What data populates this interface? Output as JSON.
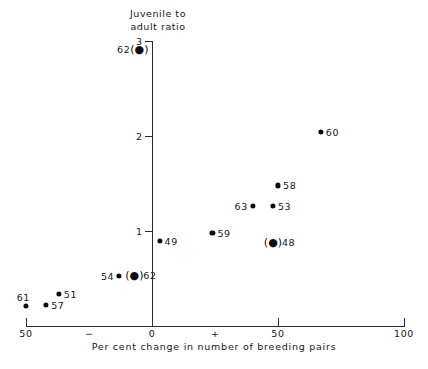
{
  "chart_data": {
    "type": "scatter",
    "title": "",
    "ylabel": "Juvenile to\nadult ratio",
    "xlabel": "Per cent change in number of breeding pairs",
    "xlim": [
      -50,
      100
    ],
    "ylim": [
      0,
      3
    ],
    "xticks": [
      -50,
      0,
      50,
      100
    ],
    "xticklabels": [
      "50",
      "0",
      "50",
      "100"
    ],
    "x_sign_minus": "−",
    "x_sign_plus": "+",
    "yticks": [
      1,
      2,
      3
    ],
    "yticklabels": [
      "1",
      "2",
      "3"
    ],
    "grid": false,
    "legend": null,
    "marker_color": "#0d0d0d",
    "points": [
      {
        "label": "62",
        "x": -5,
        "y": 2.92,
        "bracketed": true,
        "label_side": "left"
      },
      {
        "label": "60",
        "x": 67,
        "y": 2.04,
        "bracketed": false,
        "label_side": "right"
      },
      {
        "label": "58",
        "x": 50,
        "y": 1.48,
        "bracketed": false,
        "label_side": "right"
      },
      {
        "label": "63",
        "x": 40,
        "y": 1.26,
        "bracketed": false,
        "label_side": "left"
      },
      {
        "label": "53",
        "x": 48,
        "y": 1.26,
        "bracketed": false,
        "label_side": "right"
      },
      {
        "label": "59",
        "x": 24,
        "y": 0.98,
        "bracketed": false,
        "label_side": "right"
      },
      {
        "label": "49",
        "x": 3,
        "y": 0.9,
        "bracketed": false,
        "label_side": "right"
      },
      {
        "label": "48",
        "x": 48,
        "y": 0.88,
        "bracketed": true,
        "label_side": "right"
      },
      {
        "label": "54",
        "x": -13,
        "y": 0.53,
        "bracketed": false,
        "label_side": "left"
      },
      {
        "label": "62",
        "x": -7,
        "y": 0.54,
        "bracketed": true,
        "label_side": "right"
      },
      {
        "label": "51",
        "x": -37,
        "y": 0.34,
        "bracketed": false,
        "label_side": "right"
      },
      {
        "label": "57",
        "x": -42,
        "y": 0.22,
        "bracketed": false,
        "label_side": "right"
      },
      {
        "label": "61",
        "x": -50,
        "y": 0.21,
        "bracketed": false,
        "label_side": "above-left"
      }
    ]
  }
}
